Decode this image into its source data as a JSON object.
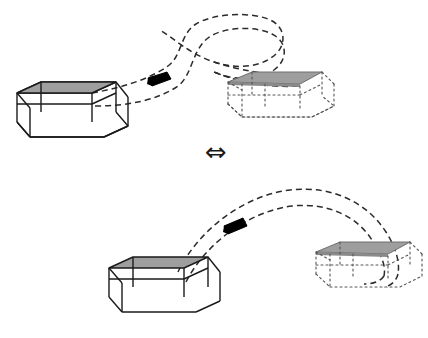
{
  "figure": {
    "type": "diagram",
    "title": "",
    "background_color": "#ffffff",
    "equivalence_symbol": "⇔",
    "panels": [
      {
        "id": "top-panel",
        "name": "top-configuration",
        "source_box": {
          "name": "solid-box-top-left",
          "style": "solid-wireframe",
          "top_face_fill": "#9e9e9e",
          "stroke": "#1a1a1a",
          "stroke_width": 1.4
        },
        "target_box": {
          "name": "flattened-box-top-right",
          "style": "dotted-wireframe",
          "top_face_fill": "#9e9e9e",
          "stroke": "#555555",
          "stroke_width": 1.1
        },
        "trajectory": {
          "name": "looping-dashed-trajectory",
          "shape": "two-crossing-loops",
          "stroke": "#2b2b2b",
          "dash": "6 4",
          "loops": 2
        },
        "marker": {
          "name": "black-patch-marker-top",
          "fill": "#000000"
        }
      },
      {
        "id": "bottom-panel",
        "name": "bottom-configuration",
        "source_box": {
          "name": "solid-box-bottom-left",
          "style": "solid-wireframe",
          "top_face_fill": "#9e9e9e",
          "stroke": "#1a1a1a",
          "stroke_width": 1.4
        },
        "target_box": {
          "name": "flattened-box-bottom-right",
          "style": "dotted-wireframe",
          "top_face_fill": "#9e9e9e",
          "stroke": "#555555",
          "stroke_width": 1.1
        },
        "trajectory": {
          "name": "arc-dashed-trajectory",
          "shape": "simple-arc",
          "stroke": "#2b2b2b",
          "dash": "6 4",
          "loops": 0
        },
        "marker": {
          "name": "black-patch-marker-bottom",
          "fill": "#000000"
        }
      }
    ],
    "colors": {
      "gray_fill": "#9e9e9e",
      "ink": "#1a1a1a",
      "dotted_ink": "#555555",
      "marker": "#000000"
    }
  }
}
